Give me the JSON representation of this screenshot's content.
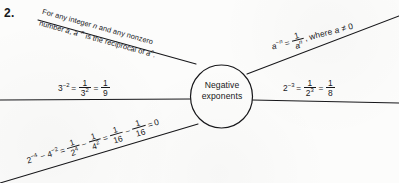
{
  "item": {
    "number": "2."
  },
  "hub": {
    "line1": "Negative",
    "line2": "exponents"
  },
  "definition": {
    "line1": "For any integer n and any nonzero",
    "line2": "number a, a⁻ⁿ is the reciprocal of aⁿ."
  },
  "branches": {
    "upper_right": {
      "label": "a⁻ⁿ = 1/aⁿ, where a ≠ 0",
      "base": "a",
      "exponent": "−n",
      "equals": "=",
      "frac_num": "1",
      "frac_den_base": "a",
      "frac_den_exp": "n",
      "condition": ", where a ≠ 0"
    },
    "mid_left": {
      "label": "3⁻² = 1/3² = 1/9",
      "base": "3",
      "exponent": "−2",
      "equals1": "=",
      "frac1_num": "1",
      "frac1_den_base": "3",
      "frac1_den_exp": "2",
      "equals2": "=",
      "frac2_num": "1",
      "frac2_den": "9"
    },
    "mid_right": {
      "label": "2⁻³ = 1/2³ = 1/8",
      "base": "2",
      "exponent": "−3",
      "equals1": "=",
      "frac1_num": "1",
      "frac1_den_base": "2",
      "frac1_den_exp": "3",
      "equals2": "=",
      "frac2_num": "1",
      "frac2_den": "8"
    },
    "lower_left": {
      "label": "2⁻⁴ − 4⁻² = 1/2⁴ − 1/4² = 1/16 − 1/16 = 0",
      "term1_base": "2",
      "term1_exp": "−4",
      "minus1": "−",
      "term2_base": "4",
      "term2_exp": "−2",
      "equals1": "=",
      "frac1_num": "1",
      "frac1_den_base": "2",
      "frac1_den_exp": "4",
      "minus2": "−",
      "frac2_num": "1",
      "frac2_den_base": "4",
      "frac2_den_exp": "2",
      "equals2": "=",
      "frac3_num": "1",
      "frac3_den": "16",
      "minus3": "−",
      "frac4_num": "1",
      "frac4_den": "16",
      "equals3": "=",
      "result": "0"
    }
  },
  "style": {
    "ink": "#17171a",
    "paper": "#fcfcfb"
  }
}
